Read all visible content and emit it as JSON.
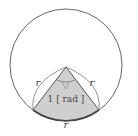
{
  "diagram": {
    "type": "circle-sector-radian",
    "labels": {
      "left_radius": "r",
      "right_radius": "r",
      "arc_length": "r",
      "angle": "1 [ rad ]"
    },
    "colors": {
      "sector_fill": "#cfcfcf",
      "stroke": "#555555",
      "circle_stroke": "#666666",
      "label": "#444444"
    }
  }
}
